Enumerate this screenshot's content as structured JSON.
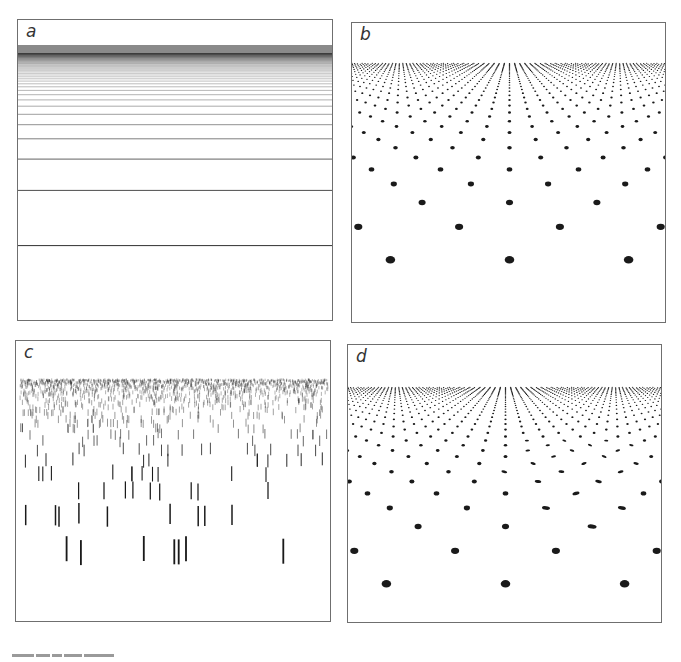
{
  "figure": {
    "panels": [
      {
        "id": "a",
        "label": "a",
        "type": "perspective-horizontal-lines",
        "description": "Horizontal lines receding toward a horizon, spacing compressing with distance"
      },
      {
        "id": "b",
        "label": "b",
        "type": "perspective-dot-grid",
        "description": "Regular lattice of dots on a ground plane in perspective"
      },
      {
        "id": "c",
        "label": "c",
        "type": "perspective-vertical-dashes",
        "description": "Randomly placed vertical line segments shrinking with distance"
      },
      {
        "id": "d",
        "label": "d",
        "type": "perspective-dot-grid-perturbed",
        "description": "Dot lattice in perspective with a region of locally distorted/tilted elements"
      }
    ],
    "colors": {
      "ink": "#1a1a1a",
      "frame": "#6f6f6f",
      "background": "#ffffff"
    }
  }
}
